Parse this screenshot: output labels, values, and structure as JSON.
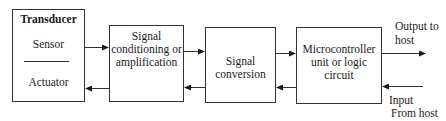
{
  "diagram": {
    "blocks": [
      {
        "id": "transducer",
        "title": "Transducer",
        "lines": [
          "Sensor",
          "Actuator"
        ]
      },
      {
        "id": "signal-conditioning",
        "lines": [
          "Signal",
          "conditioning or",
          "amplification"
        ]
      },
      {
        "id": "signal-conversion",
        "lines": [
          "Signal",
          "conversion"
        ]
      },
      {
        "id": "microcontroller",
        "lines": [
          "Microcontroller",
          "unit or logic",
          "circuit"
        ]
      }
    ],
    "external": {
      "output": [
        "Output to",
        "host"
      ],
      "input": [
        "Input",
        "From host"
      ]
    },
    "connections": [
      {
        "from": "transducer",
        "to": "signal-conditioning",
        "direction": "forward"
      },
      {
        "from": "signal-conditioning",
        "to": "transducer",
        "direction": "backward"
      },
      {
        "from": "signal-conditioning",
        "to": "signal-conversion",
        "direction": "forward"
      },
      {
        "from": "signal-conversion",
        "to": "signal-conditioning",
        "direction": "backward"
      },
      {
        "from": "signal-conversion",
        "to": "microcontroller",
        "direction": "forward"
      },
      {
        "from": "microcontroller",
        "to": "signal-conversion",
        "direction": "backward"
      },
      {
        "from": "microcontroller",
        "to": "host",
        "direction": "forward"
      },
      {
        "from": "host",
        "to": "microcontroller",
        "direction": "backward"
      }
    ]
  }
}
